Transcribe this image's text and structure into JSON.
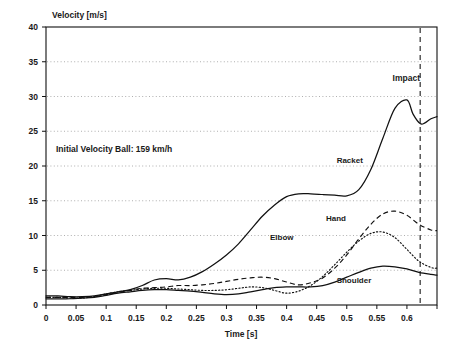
{
  "chart_data": {
    "type": "line",
    "title": "",
    "xlabel": "Time [s]",
    "ylabel": "Velocity [m/s]",
    "xlim": [
      0,
      0.65
    ],
    "ylim": [
      0,
      40
    ],
    "xticks": [
      0,
      0.05,
      0.1,
      0.15,
      0.2,
      0.25,
      0.3,
      0.35,
      0.4,
      0.45,
      0.5,
      0.55,
      0.6
    ],
    "xtick_labels": [
      "0",
      "0.05",
      "0.1",
      "0.15",
      "0.2",
      "0.25",
      "0.3",
      "0.35",
      "0.4",
      "0.45",
      "0.5",
      "0.55",
      "0.6"
    ],
    "yticks": [
      0,
      5,
      10,
      15,
      20,
      25,
      30,
      35,
      40
    ],
    "ytick_labels": [
      "0",
      "5",
      "10",
      "15",
      "20",
      "25",
      "30",
      "35",
      "40"
    ],
    "grid": "horizontal-dotted",
    "legend_position": "inline-labels",
    "annotations": [
      {
        "name": "initial-velocity",
        "text": "Initial Velocity Ball:  159 km/h",
        "x": 0.03,
        "y": 22.5
      },
      {
        "name": "impact",
        "text": "Impact",
        "x": 0.585,
        "y": 32.0
      },
      {
        "name": "impact-line-time",
        "text": "",
        "x": 0.622,
        "y": 40
      }
    ],
    "impact_time": 0.622,
    "series": [
      {
        "name": "Racket",
        "style": "solid",
        "label_x": 0.505,
        "label_y": 20.5,
        "x": [
          0,
          0.02,
          0.04,
          0.06,
          0.08,
          0.1,
          0.12,
          0.14,
          0.16,
          0.18,
          0.2,
          0.22,
          0.24,
          0.26,
          0.28,
          0.3,
          0.32,
          0.34,
          0.36,
          0.38,
          0.4,
          0.42,
          0.44,
          0.46,
          0.48,
          0.5,
          0.52,
          0.54,
          0.56,
          0.58,
          0.6,
          0.61,
          0.622,
          0.63,
          0.64,
          0.65
        ],
        "y": [
          1.3,
          1.3,
          1.2,
          1.2,
          1.3,
          1.6,
          1.9,
          2.2,
          2.8,
          3.6,
          3.8,
          3.6,
          4.0,
          4.8,
          5.9,
          7.2,
          8.8,
          10.8,
          12.8,
          14.4,
          15.6,
          16.0,
          16.0,
          15.9,
          15.8,
          15.7,
          16.6,
          19.5,
          24.0,
          28.3,
          29.5,
          27.5,
          26.1,
          26.2,
          26.8,
          27.1
        ]
      },
      {
        "name": "Hand",
        "style": "dashed",
        "label_x": 0.482,
        "label_y": 12.1,
        "x": [
          0,
          0.02,
          0.04,
          0.06,
          0.08,
          0.1,
          0.12,
          0.14,
          0.16,
          0.18,
          0.2,
          0.22,
          0.24,
          0.26,
          0.28,
          0.3,
          0.32,
          0.34,
          0.36,
          0.38,
          0.4,
          0.42,
          0.44,
          0.46,
          0.48,
          0.5,
          0.52,
          0.54,
          0.56,
          0.58,
          0.6,
          0.62,
          0.64,
          0.65
        ],
        "y": [
          1.1,
          1.1,
          1.1,
          1.1,
          1.2,
          1.5,
          1.8,
          2.1,
          2.4,
          2.5,
          2.6,
          2.8,
          2.8,
          2.9,
          3.1,
          3.4,
          3.7,
          3.9,
          4.0,
          3.8,
          3.3,
          2.9,
          3.2,
          3.9,
          5.3,
          7.2,
          9.5,
          11.6,
          13.1,
          13.5,
          12.9,
          11.6,
          10.8,
          10.7
        ]
      },
      {
        "name": "Elbow",
        "style": "dotted",
        "label_x": 0.392,
        "label_y": 9.3,
        "x": [
          0,
          0.02,
          0.04,
          0.06,
          0.08,
          0.1,
          0.12,
          0.14,
          0.16,
          0.18,
          0.2,
          0.22,
          0.24,
          0.26,
          0.28,
          0.3,
          0.32,
          0.34,
          0.36,
          0.38,
          0.4,
          0.42,
          0.44,
          0.46,
          0.48,
          0.5,
          0.52,
          0.54,
          0.56,
          0.58,
          0.6,
          0.62,
          0.64,
          0.65
        ],
        "y": [
          1.1,
          1.1,
          1.0,
          1.0,
          1.2,
          1.6,
          1.9,
          2.1,
          2.3,
          2.4,
          2.4,
          2.3,
          2.2,
          2.1,
          2.1,
          2.2,
          2.4,
          2.6,
          2.5,
          2.1,
          1.7,
          2.0,
          2.8,
          4.1,
          5.8,
          7.6,
          9.2,
          10.3,
          10.5,
          9.7,
          8.0,
          6.3,
          5.4,
          5.3
        ]
      },
      {
        "name": "Shoulder",
        "style": "solid",
        "label_x": 0.512,
        "label_y": 3.1,
        "x": [
          0,
          0.02,
          0.04,
          0.06,
          0.08,
          0.1,
          0.12,
          0.14,
          0.16,
          0.18,
          0.2,
          0.22,
          0.24,
          0.26,
          0.28,
          0.3,
          0.32,
          0.34,
          0.36,
          0.38,
          0.4,
          0.42,
          0.44,
          0.46,
          0.48,
          0.5,
          0.52,
          0.54,
          0.56,
          0.58,
          0.6,
          0.62,
          0.64,
          0.65
        ],
        "y": [
          0.9,
          0.9,
          0.9,
          1.0,
          1.1,
          1.4,
          1.7,
          1.9,
          2.1,
          2.2,
          2.2,
          2.1,
          2.0,
          1.8,
          1.6,
          1.5,
          1.6,
          1.9,
          2.2,
          2.5,
          2.6,
          2.6,
          2.6,
          2.8,
          3.3,
          4.0,
          4.7,
          5.3,
          5.6,
          5.5,
          5.2,
          4.7,
          4.4,
          4.3
        ]
      }
    ]
  },
  "labels": {
    "ylabel": "Velocity [m/s]",
    "xlabel": "Time [s]",
    "racket": "Racket",
    "hand": "Hand",
    "elbow": "Elbow",
    "shoulder": "Shoulder",
    "impact": "Impact",
    "initial_velocity": "Initial Velocity Ball:  159 km/h"
  },
  "colors": {
    "line": "#111111",
    "grid": "#9a9a9a",
    "background": "#ffffff"
  }
}
